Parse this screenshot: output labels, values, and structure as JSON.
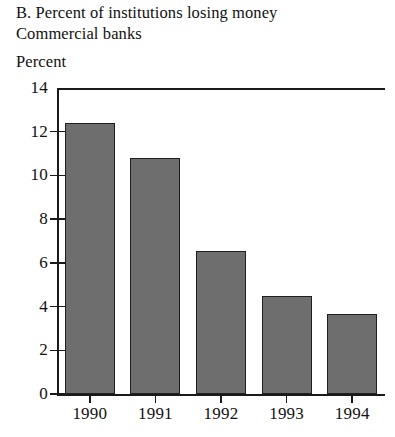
{
  "title": {
    "line1": "B. Percent of institutions losing money",
    "line2": "Commercial banks"
  },
  "axis_title": "Percent",
  "colors": {
    "bar_fill": "#6e6e6e",
    "bar_outline": "#1f1f1f",
    "axis": "#1a1a1a",
    "background": "#ffffff",
    "text": "#111111"
  },
  "chart_data": {
    "type": "bar",
    "title": "B. Percent of institutions losing money",
    "subtitle": "Commercial banks",
    "xlabel": "",
    "ylabel": "Percent",
    "categories": [
      "1990",
      "1991",
      "1992",
      "1993",
      "1994"
    ],
    "values": [
      12.4,
      10.8,
      6.55,
      4.5,
      3.65
    ],
    "ylim": [
      0,
      14
    ],
    "yticks": [
      0,
      2,
      4,
      6,
      8,
      10,
      12,
      14
    ],
    "ytick_labels": [
      "0",
      "2",
      "4",
      "6",
      "8",
      "10",
      "12",
      "14"
    ],
    "grid": false,
    "legend": null,
    "series": [
      {
        "name": "Commercial banks",
        "values": [
          12.4,
          10.8,
          6.55,
          4.5,
          3.65
        ]
      }
    ]
  }
}
